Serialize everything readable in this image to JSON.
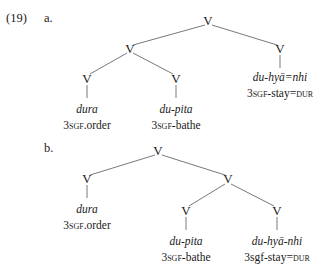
{
  "example": {
    "number": "(19)",
    "items": [
      {
        "label": "a."
      },
      {
        "label": "b."
      }
    ]
  },
  "node_label": "V",
  "trees": [
    {
      "id": "a",
      "item_label": "a.",
      "leaves": [
        {
          "form": "dura",
          "gloss_parts": [
            {
              "text": "3",
              "style": "normal"
            },
            {
              "text": "SGF",
              "style": "smallcaps"
            },
            {
              "text": ".order",
              "style": "normal"
            }
          ],
          "gloss_plain": "3SGF.order"
        },
        {
          "form": "du-pita",
          "gloss_parts": [
            {
              "text": "3",
              "style": "normal"
            },
            {
              "text": "SGF",
              "style": "smallcaps"
            },
            {
              "text": "-bathe",
              "style": "normal"
            }
          ],
          "gloss_plain": "3SGF-bathe"
        },
        {
          "form": "du-hyā=nhi",
          "gloss_parts": [
            {
              "text": "3",
              "style": "normal"
            },
            {
              "text": "SGF",
              "style": "smallcaps"
            },
            {
              "text": "-stay=",
              "style": "normal"
            },
            {
              "text": "DUR",
              "style": "smallcaps"
            }
          ],
          "gloss_plain": "3SGF-stay=DUR"
        }
      ]
    },
    {
      "id": "b",
      "item_label": "b.",
      "leaves": [
        {
          "form": "dura",
          "gloss_parts": [
            {
              "text": "3",
              "style": "normal"
            },
            {
              "text": "SGF",
              "style": "smallcaps"
            },
            {
              "text": ".order",
              "style": "normal"
            }
          ],
          "gloss_plain": "3SGF.order"
        },
        {
          "form": "du-pita",
          "gloss_parts": [
            {
              "text": "3",
              "style": "normal"
            },
            {
              "text": "SGF",
              "style": "smallcaps"
            },
            {
              "text": "-bathe",
              "style": "normal"
            }
          ],
          "gloss_plain": "3SGF-bathe"
        },
        {
          "form": "du-hyā-nhi",
          "gloss_parts": [
            {
              "text": "3sgf",
              "style": "lowercase"
            },
            {
              "text": "-stay=",
              "style": "normal"
            },
            {
              "text": "DUR",
              "style": "smallcaps"
            }
          ],
          "gloss_plain": "3sgf-stay=DUR"
        }
      ]
    }
  ],
  "colors": {
    "text": "#1a1a1a",
    "branch": "#55555c",
    "background": "#ffffff"
  }
}
